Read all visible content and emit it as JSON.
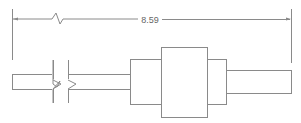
{
  "diagram": {
    "type": "technical-drawing",
    "dimension": {
      "label": "8.59",
      "orientation": "horizontal"
    },
    "colors": {
      "line": "#8a8a8a",
      "text": "#666666",
      "background": "#ffffff"
    }
  }
}
